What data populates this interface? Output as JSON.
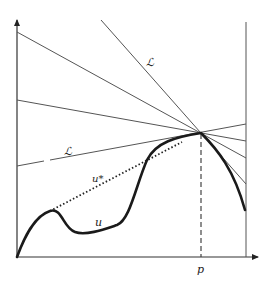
{
  "figure": {
    "labels": {
      "line_upper": "ℒ",
      "line_lower": "ℒ",
      "envelope": "u*",
      "curve": "u",
      "x_point": "p"
    },
    "colors": {
      "ink": "#1a1a1a",
      "thin_line": "#555555",
      "background": "#ffffff"
    }
  }
}
